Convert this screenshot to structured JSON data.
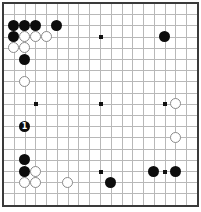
{
  "board": {
    "size": 19,
    "origin_x": 3,
    "origin_y": 3,
    "spacing_x": 10.78,
    "spacing_y": 11.2,
    "colors": {
      "black": "#0d0d0d",
      "white": "#ffffff",
      "grid": "#b8b8b8",
      "border": "#3a3a3a"
    },
    "star_points": [
      [
        3,
        3
      ],
      [
        9,
        3
      ],
      [
        15,
        3
      ],
      [
        3,
        9
      ],
      [
        9,
        9
      ],
      [
        15,
        9
      ],
      [
        3,
        15
      ],
      [
        9,
        15
      ],
      [
        15,
        15
      ]
    ],
    "stones": [
      {
        "color": "black",
        "col": 1,
        "row": 2,
        "label": ""
      },
      {
        "color": "black",
        "col": 2,
        "row": 2,
        "label": ""
      },
      {
        "color": "black",
        "col": 3,
        "row": 2,
        "label": ""
      },
      {
        "color": "black",
        "col": 5,
        "row": 2,
        "label": ""
      },
      {
        "color": "black",
        "col": 1,
        "row": 3,
        "label": ""
      },
      {
        "color": "white",
        "col": 2,
        "row": 3,
        "label": ""
      },
      {
        "color": "white",
        "col": 3,
        "row": 3,
        "label": ""
      },
      {
        "color": "white",
        "col": 4,
        "row": 3,
        "label": ""
      },
      {
        "color": "white",
        "col": 1,
        "row": 4,
        "label": ""
      },
      {
        "color": "white",
        "col": 2,
        "row": 4,
        "label": ""
      },
      {
        "color": "black",
        "col": 2,
        "row": 5,
        "label": ""
      },
      {
        "color": "white",
        "col": 2,
        "row": 7,
        "label": ""
      },
      {
        "color": "black",
        "col": 15,
        "row": 3,
        "label": ""
      },
      {
        "color": "white",
        "col": 16,
        "row": 9,
        "label": ""
      },
      {
        "color": "black",
        "col": 2,
        "row": 11,
        "label": "1"
      },
      {
        "color": "white",
        "col": 16,
        "row": 12,
        "label": ""
      },
      {
        "color": "black",
        "col": 2,
        "row": 14,
        "label": ""
      },
      {
        "color": "black",
        "col": 2,
        "row": 15,
        "label": ""
      },
      {
        "color": "white",
        "col": 3,
        "row": 15,
        "label": ""
      },
      {
        "color": "white",
        "col": 2,
        "row": 16,
        "label": ""
      },
      {
        "color": "white",
        "col": 3,
        "row": 16,
        "label": ""
      },
      {
        "color": "white",
        "col": 6,
        "row": 16,
        "label": ""
      },
      {
        "color": "black",
        "col": 10,
        "row": 16,
        "label": ""
      },
      {
        "color": "black",
        "col": 14,
        "row": 15,
        "label": ""
      },
      {
        "color": "black",
        "col": 16,
        "row": 15,
        "label": ""
      }
    ]
  }
}
